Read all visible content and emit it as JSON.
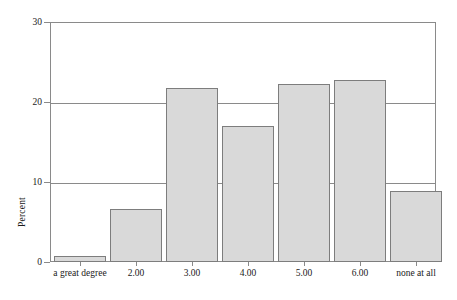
{
  "chart_data": {
    "type": "bar",
    "title": "",
    "xlabel": "",
    "ylabel": "Percent",
    "categories": [
      "a great degree",
      "2.00",
      "3.00",
      "4.00",
      "5.00",
      "6.00",
      "none at all"
    ],
    "values": [
      0.8,
      6.6,
      21.8,
      17.0,
      22.2,
      22.8,
      8.9
    ],
    "ylim": [
      0,
      30
    ],
    "yticks": [
      0,
      10,
      20,
      30
    ],
    "ytick_labels": [
      "0",
      "10",
      "20",
      "30"
    ],
    "grid": true,
    "legend": "none",
    "bar_fill_color": "#d9d9d9",
    "bar_border_color": "#7d7d7d",
    "axis_color": "#8a8a8a",
    "background_color": "#ffffff"
  }
}
